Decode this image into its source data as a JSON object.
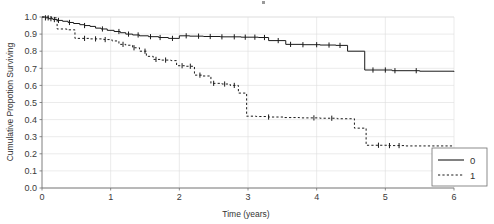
{
  "chart_data": {
    "type": "line",
    "title": "",
    "xlabel": "Time (years)",
    "ylabel": "Cumulative Propotion Surviving",
    "xlim": [
      0,
      6
    ],
    "ylim": [
      0.0,
      1.0
    ],
    "xticks": [
      "0",
      "1",
      "2",
      "3",
      "4",
      "5",
      "6"
    ],
    "yticks": [
      "0.0",
      "0.1",
      "0.2",
      "0.3",
      "0.4",
      "0.5",
      "0.6",
      "0.7",
      "0.8",
      "0.9",
      "1.0"
    ],
    "grid": true,
    "legend_position": "bottom-right",
    "legend_entries": [
      {
        "label": "0",
        "style": "solid"
      },
      {
        "label": "1",
        "style": "dotted"
      }
    ],
    "series": [
      {
        "name": "0",
        "style": "solid",
        "points": [
          [
            0.0,
            1.0
          ],
          [
            0.05,
            0.995
          ],
          [
            0.1,
            0.99
          ],
          [
            0.16,
            0.985
          ],
          [
            0.22,
            0.98
          ],
          [
            0.3,
            0.975
          ],
          [
            0.38,
            0.968
          ],
          [
            0.46,
            0.962
          ],
          [
            0.55,
            0.955
          ],
          [
            0.62,
            0.95
          ],
          [
            0.7,
            0.945
          ],
          [
            0.78,
            0.935
          ],
          [
            0.86,
            0.93
          ],
          [
            0.95,
            0.922
          ],
          [
            1.05,
            0.915
          ],
          [
            1.14,
            0.908
          ],
          [
            1.22,
            0.9
          ],
          [
            1.32,
            0.895
          ],
          [
            1.42,
            0.89
          ],
          [
            1.55,
            0.885
          ],
          [
            1.7,
            0.88
          ],
          [
            1.84,
            0.875
          ],
          [
            2.0,
            0.89
          ],
          [
            2.15,
            0.888
          ],
          [
            2.35,
            0.886
          ],
          [
            2.6,
            0.884
          ],
          [
            2.9,
            0.882
          ],
          [
            3.15,
            0.88
          ],
          [
            3.3,
            0.862
          ],
          [
            3.55,
            0.84
          ],
          [
            3.8,
            0.838
          ],
          [
            4.05,
            0.836
          ],
          [
            4.28,
            0.834
          ],
          [
            4.45,
            0.8
          ],
          [
            4.7,
            0.69
          ],
          [
            5.1,
            0.686
          ],
          [
            5.5,
            0.683
          ],
          [
            6.0,
            0.68
          ]
        ],
        "censor_times": [
          0.05,
          0.09,
          0.13,
          0.18,
          0.24,
          0.4,
          0.62,
          0.88,
          1.12,
          1.26,
          1.4,
          1.58,
          1.72,
          1.9,
          2.1,
          2.28,
          2.45,
          2.62,
          2.8,
          2.96,
          3.1,
          3.24,
          3.44,
          3.62,
          3.8,
          4.0,
          4.18,
          4.34,
          4.82,
          5.0,
          5.14,
          5.45
        ]
      },
      {
        "name": "1",
        "style": "dotted",
        "points": [
          [
            0.0,
            1.0
          ],
          [
            0.14,
            0.995
          ],
          [
            0.22,
            0.93
          ],
          [
            0.36,
            0.925
          ],
          [
            0.48,
            0.875
          ],
          [
            0.7,
            0.872
          ],
          [
            0.9,
            0.868
          ],
          [
            1.02,
            0.86
          ],
          [
            1.12,
            0.84
          ],
          [
            1.22,
            0.835
          ],
          [
            1.32,
            0.82
          ],
          [
            1.42,
            0.8
          ],
          [
            1.52,
            0.77
          ],
          [
            1.62,
            0.752
          ],
          [
            1.74,
            0.748
          ],
          [
            1.88,
            0.745
          ],
          [
            1.96,
            0.715
          ],
          [
            2.1,
            0.712
          ],
          [
            2.22,
            0.66
          ],
          [
            2.34,
            0.655
          ],
          [
            2.46,
            0.612
          ],
          [
            2.62,
            0.608
          ],
          [
            2.74,
            0.6
          ],
          [
            2.86,
            0.555
          ],
          [
            2.98,
            0.42
          ],
          [
            3.12,
            0.418
          ],
          [
            3.3,
            0.415
          ],
          [
            3.52,
            0.412
          ],
          [
            3.75,
            0.41
          ],
          [
            4.05,
            0.408
          ],
          [
            4.3,
            0.405
          ],
          [
            4.55,
            0.35
          ],
          [
            4.72,
            0.25
          ],
          [
            5.05,
            0.248
          ],
          [
            5.3,
            0.246
          ],
          [
            6.0,
            0.245
          ]
        ],
        "censor_times": [
          0.62,
          0.78,
          0.92,
          1.18,
          1.34,
          1.5,
          1.66,
          1.8,
          2.04,
          2.16,
          2.3,
          2.5,
          2.66,
          2.8,
          3.3,
          3.96,
          4.22,
          4.9,
          5.06,
          5.2
        ]
      }
    ]
  },
  "axis_titles": {
    "x": "Time (years)",
    "y": "Cumulative Propotion Surviving"
  },
  "colors": {
    "curve": "#1a1a1a",
    "grid": "#dddddd",
    "axis": "#6f6f6f",
    "background": "#ffffff"
  }
}
